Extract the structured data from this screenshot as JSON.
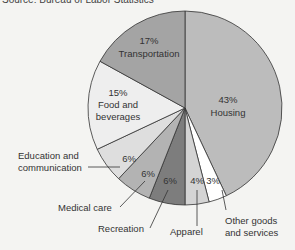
{
  "source_text": "Source: Bureau of Labor Statistics",
  "chart_data": {
    "type": "pie",
    "title": "",
    "categories": [
      "Housing",
      "Other goods and services",
      "Apparel",
      "Recreation",
      "Medical care",
      "Education and communication",
      "Food and beverages",
      "Transportation"
    ],
    "values": [
      43,
      3,
      4,
      6,
      6,
      6,
      15,
      17
    ],
    "labels": [
      "43%",
      "3%",
      "4%",
      "6%",
      "6%",
      "6%",
      "15%",
      "17%"
    ],
    "colors": [
      "#bcbcbc",
      "#ffffff",
      "#d4d4d4",
      "#7d7d7d",
      "#b3b3b3",
      "#dedede",
      "#eeeeee",
      "#a4a4a4"
    ],
    "start_angle_deg": 0,
    "direction": "clockwise",
    "legend_position": "callouts"
  },
  "inside_labels": {
    "housing_pct": "43%",
    "housing": "Housing",
    "transport_pct": "17%",
    "transport": "Transportation",
    "food_pct": "15%",
    "food1": "Food and",
    "food2": "beverages",
    "edu_pct": "6%",
    "med_pct": "6%",
    "rec_pct": "6%",
    "app_pct": "4%",
    "other_pct": "3%"
  },
  "callouts": {
    "edu1": "Education and",
    "edu2": "communication",
    "med": "Medical care",
    "rec": "Recreation",
    "app": "Apparel",
    "other1": "Other goods",
    "other2": "and services"
  }
}
